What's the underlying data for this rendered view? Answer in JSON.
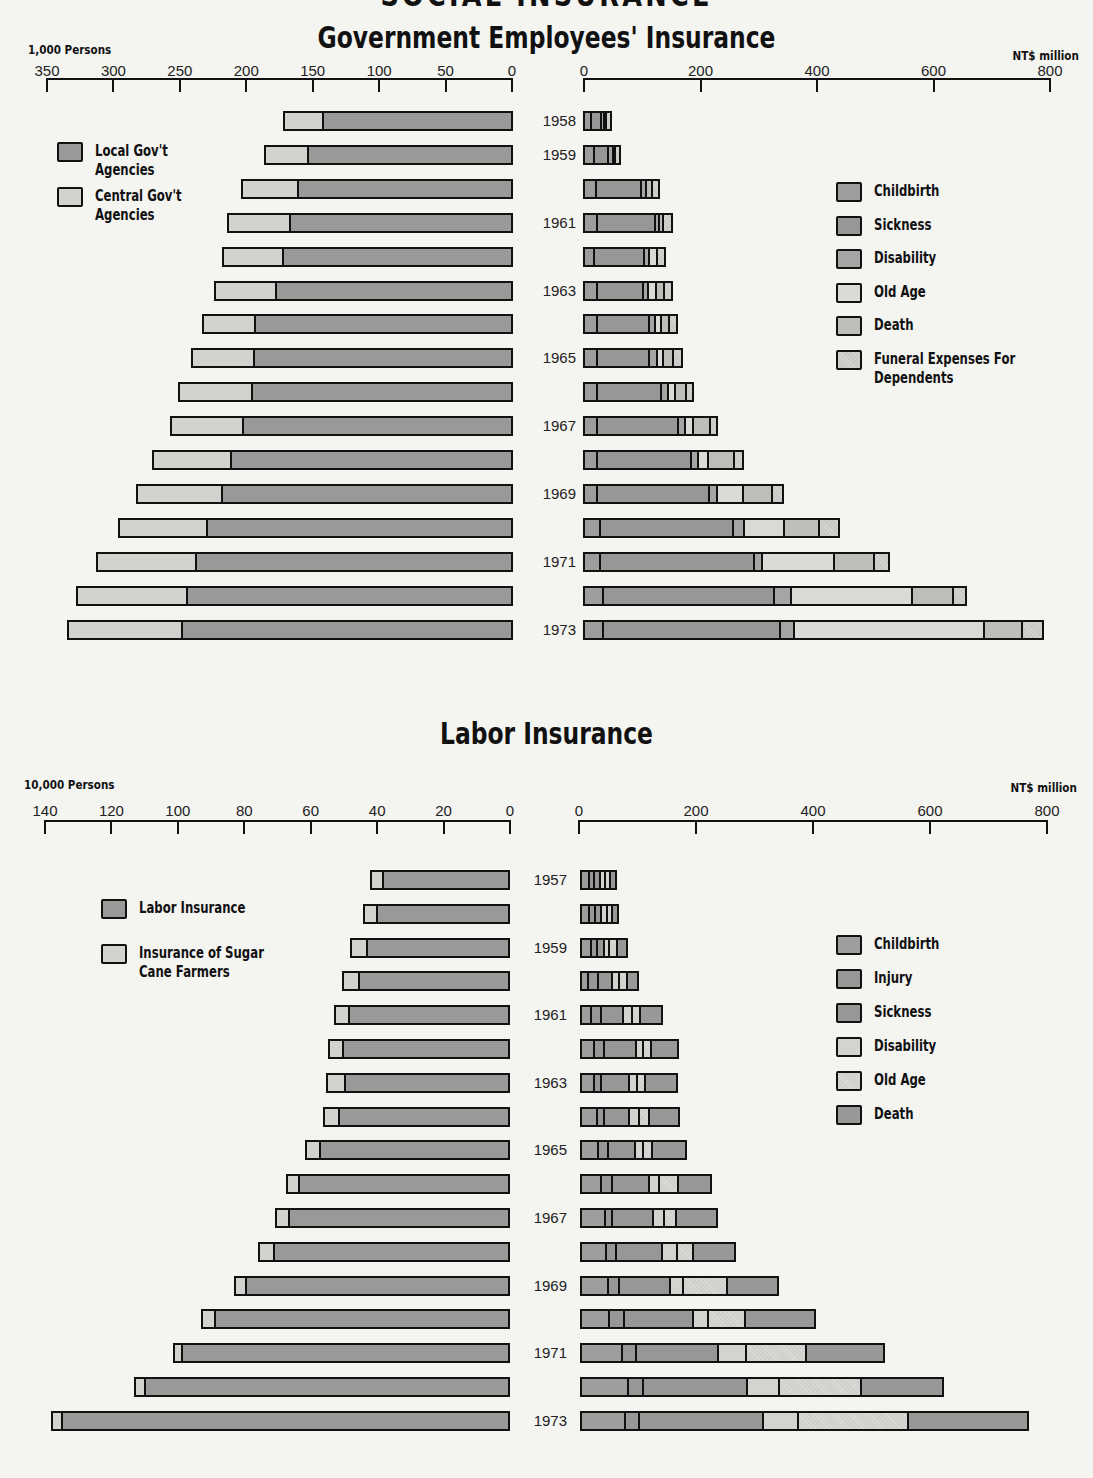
{
  "page": {
    "cut_title": "SOCIAL INSURANCE"
  },
  "colors": {
    "local_gov": "#999997",
    "central_gov": "#d2d2cf",
    "childbirth": "#9d9d9b",
    "sickness": "#979795",
    "disability": "#a5a5a3",
    "old_age": "#dadad7",
    "death": "#bdbdba",
    "funeral": "#c8c8c5",
    "labor": "#999997",
    "sugar": "#d2d2cf",
    "l_childbirth": "#9e9e9c",
    "l_injury": "#979795",
    "l_sickness": "#979795",
    "l_disability": "#d3d3d0",
    "l_old_age": "#cfcfcc",
    "l_death": "#989896"
  },
  "government": {
    "title": "Government Employees' Insurance",
    "left_unit": "1,000 Persons",
    "right_unit": "NT$ million",
    "left_ticks": [
      "350",
      "300",
      "250",
      "200",
      "150",
      "100",
      "50",
      "0"
    ],
    "right_ticks": [
      "0",
      "200",
      "400",
      "600",
      "800"
    ],
    "left_legend": [
      {
        "label": "Local Gov't\nAgencies",
        "line1": "Local Gov't",
        "line2": "Agencies",
        "color_key": "local_gov"
      },
      {
        "label": "Central Gov't\nAgencies",
        "line1": "Central Gov't",
        "line2": "Agencies",
        "color_key": "central_gov"
      }
    ],
    "right_legend": [
      {
        "line1": "Childbirth",
        "line2": "",
        "color_key": "childbirth"
      },
      {
        "line1": "Sickness",
        "line2": "",
        "color_key": "sickness"
      },
      {
        "line1": "Disability",
        "line2": "",
        "color_key": "disability"
      },
      {
        "line1": "Old Age",
        "line2": "",
        "color_key": "old_age"
      },
      {
        "line1": "Death",
        "line2": "",
        "color_key": "death"
      },
      {
        "line1": "Funeral Expenses For",
        "line2": "Dependents",
        "color_key": "funeral"
      }
    ],
    "year_labels": [
      "1958",
      "1959",
      "",
      "1961",
      "",
      "1963",
      "",
      "1965",
      "",
      "1967",
      "",
      "1969",
      "",
      "1971",
      "",
      "1973"
    ]
  },
  "labor": {
    "title": "Labor Insurance",
    "left_unit": "10,000 Persons",
    "right_unit": "NT$ million",
    "left_ticks": [
      "140",
      "120",
      "100",
      "80",
      "60",
      "40",
      "20",
      "0"
    ],
    "right_ticks": [
      "0",
      "200",
      "400",
      "600",
      "800"
    ],
    "left_legend": [
      {
        "line1": "Labor Insurance",
        "line2": "",
        "color_key": "labor"
      },
      {
        "line1": "Insurance of Sugar",
        "line2": "Cane Farmers",
        "color_key": "sugar"
      }
    ],
    "right_legend": [
      {
        "line1": "Childbirth",
        "line2": "",
        "color_key": "l_childbirth"
      },
      {
        "line1": "Injury",
        "line2": "",
        "color_key": "l_injury"
      },
      {
        "line1": "Sickness",
        "line2": "",
        "color_key": "l_sickness"
      },
      {
        "line1": "Disability",
        "line2": "",
        "color_key": "l_disability"
      },
      {
        "line1": "Old Age",
        "line2": "",
        "color_key": "l_old_age"
      },
      {
        "line1": "Death",
        "line2": "",
        "color_key": "l_death"
      }
    ],
    "year_labels": [
      "1957",
      "",
      "1959",
      "",
      "1961",
      "",
      "1963",
      "",
      "1965",
      "",
      "1967",
      "",
      "1969",
      "",
      "1971",
      "",
      "1973"
    ]
  },
  "chart_data": [
    {
      "type": "bar",
      "orientation": "horizontal",
      "stacked": true,
      "title": "Government Employees' Insurance — Insured Persons",
      "xlabel": "1,000 Persons",
      "xlim": [
        0,
        350
      ],
      "x_direction": "reversed",
      "categories": [
        "1958",
        "1959",
        "1960",
        "1961",
        "1962",
        "1963",
        "1964",
        "1965",
        "1966",
        "1967",
        "1968",
        "1969",
        "1970",
        "1971",
        "1972",
        "1973"
      ],
      "series": [
        {
          "name": "Local Gov't Agencies",
          "values": [
            143,
            154,
            162,
            168,
            173,
            178,
            194,
            195,
            196,
            203,
            212,
            219,
            230,
            238,
            245,
            249
          ]
        },
        {
          "name": "Central Gov't Agencies",
          "values": [
            30,
            33,
            42,
            47,
            46,
            47,
            40,
            47,
            56,
            55,
            59,
            64,
            67,
            75,
            83,
            86
          ]
        }
      ]
    },
    {
      "type": "bar",
      "orientation": "horizontal",
      "stacked": true,
      "title": "Government Employees' Insurance — Benefit Payments",
      "xlabel": "NT$ million",
      "xlim": [
        0,
        800
      ],
      "categories": [
        "1958",
        "1959",
        "1960",
        "1961",
        "1962",
        "1963",
        "1964",
        "1965",
        "1966",
        "1967",
        "1968",
        "1969",
        "1970",
        "1971",
        "1972",
        "1973"
      ],
      "series": [
        {
          "name": "Childbirth",
          "values": [
            9,
            15,
            19,
            19,
            14,
            19,
            19,
            19,
            19,
            19,
            19,
            19,
            24,
            24,
            29,
            29
          ]
        },
        {
          "name": "Sickness",
          "values": [
            21,
            27,
            81,
            105,
            91,
            84,
            94,
            93,
            115,
            144,
            165,
            196,
            232,
            268,
            297,
            307
          ]
        },
        {
          "name": "Disability",
          "values": [
            5,
            9,
            9,
            7,
            9,
            9,
            10,
            15,
            12,
            12,
            14,
            15,
            19,
            14,
            29,
            24
          ]
        },
        {
          "name": "Old Age",
          "values": [
            0,
            0,
            0,
            0,
            14,
            14,
            12,
            10,
            12,
            14,
            17,
            45,
            70,
            125,
            211,
            330
          ]
        },
        {
          "name": "Death",
          "values": [
            5,
            5,
            10,
            7,
            0,
            14,
            14,
            19,
            21,
            31,
            45,
            51,
            62,
            70,
            70,
            65
          ]
        },
        {
          "name": "Funeral Expenses For Dependents",
          "values": [
            10,
            10,
            14,
            17,
            14,
            14,
            14,
            15,
            12,
            12,
            17,
            19,
            34,
            26,
            24,
            36
          ]
        }
      ]
    },
    {
      "type": "bar",
      "orientation": "horizontal",
      "stacked": true,
      "title": "Labor Insurance — Insured Persons",
      "xlabel": "10,000 Persons",
      "xlim": [
        0,
        140
      ],
      "x_direction": "reversed",
      "categories": [
        "1957",
        "1958",
        "1959",
        "1960",
        "1961",
        "1962",
        "1963",
        "1964",
        "1965",
        "1966",
        "1967",
        "1968",
        "1969",
        "1970",
        "1971",
        "1972",
        "1973"
      ],
      "series": [
        {
          "name": "Labor Insurance",
          "values": [
            38.6,
            40.4,
            43.4,
            45.8,
            48.8,
            50.6,
            50.0,
            51.8,
            57.5,
            63.9,
            66.9,
            71.4,
            79.8,
            89.2,
            99.1,
            110.2,
            135.2
          ]
        },
        {
          "name": "Insurance of Sugar Cane Farmers",
          "values": [
            3.6,
            3.9,
            4.8,
            4.8,
            4.2,
            4.2,
            5.4,
            4.5,
            4.2,
            3.6,
            3.9,
            4.5,
            3.3,
            3.9,
            2.4,
            3.1,
            3.1
          ]
        }
      ]
    },
    {
      "type": "bar",
      "orientation": "horizontal",
      "stacked": true,
      "title": "Labor Insurance — Benefit Payments",
      "xlabel": "NT$ million",
      "xlim": [
        0,
        800
      ],
      "categories": [
        "1957",
        "1958",
        "1959",
        "1960",
        "1961",
        "1962",
        "1963",
        "1964",
        "1965",
        "1966",
        "1967",
        "1968",
        "1969",
        "1970",
        "1971",
        "1972",
        "1973"
      ],
      "series": [
        {
          "name": "Childbirth",
          "values": [
            11,
            11,
            14,
            9,
            15,
            20,
            20,
            24,
            27,
            32,
            39,
            41,
            43,
            46,
            68,
            78,
            73
          ]
        },
        {
          "name": "Injury",
          "values": [
            10,
            11,
            12,
            19,
            17,
            17,
            12,
            14,
            17,
            19,
            12,
            17,
            19,
            26,
            24,
            26,
            24
          ]
        },
        {
          "name": "Sickness",
          "values": [
            11,
            12,
            14,
            26,
            39,
            58,
            49,
            44,
            48,
            65,
            72,
            80,
            90,
            119,
            142,
            179,
            213
          ]
        },
        {
          "name": "Disability",
          "values": [
            10,
            11,
            9,
            12,
            17,
            12,
            15,
            17,
            14,
            17,
            20,
            26,
            22,
            26,
            48,
            55,
            61
          ]
        },
        {
          "name": "Old Age",
          "values": [
            10,
            11,
            14,
            15,
            15,
            14,
            15,
            19,
            17,
            34,
            20,
            29,
            77,
            65,
            104,
            142,
            189
          ]
        },
        {
          "name": "Death",
          "values": [
            11,
            11,
            19,
            20,
            38,
            48,
            56,
            53,
            60,
            58,
            73,
            73,
            89,
            121,
            135,
            142,
            206
          ]
        }
      ]
    }
  ]
}
